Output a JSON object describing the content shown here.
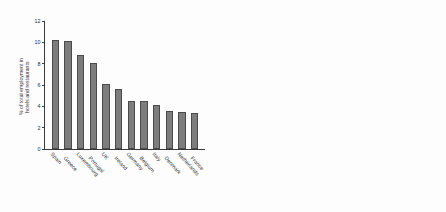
{
  "figure": {
    "background": "#fdfdfd",
    "bar_color": "#7d7d7d",
    "bar_edge_color": "#4a4a4a",
    "axis_color": "#3a3a3a",
    "text_color": "#2b2b2b"
  },
  "chart_data": [
    {
      "type": "bar",
      "title": "",
      "xlabel": "",
      "ylabel": "% of total employment in\nhotels and restaurants",
      "ylim": [
        0,
        12
      ],
      "yticks": [
        0,
        2,
        4,
        6,
        8,
        10,
        12
      ],
      "ytick_labels": [
        "0",
        "2",
        "4",
        "6",
        "8",
        "10",
        "12"
      ],
      "grid": false,
      "legend": false,
      "categories": [
        "Spain",
        "Greece",
        "Luxembourg",
        "Portugal",
        "UK",
        "Ireland",
        "Germany",
        "Belgium",
        "Italy",
        "Denmark",
        "Netherlands",
        "France"
      ],
      "values": [
        10.2,
        10.1,
        8.8,
        8.1,
        6.1,
        5.6,
        4.5,
        4.5,
        4.1,
        3.6,
        3.5,
        3.4
      ]
    },
    {
      "type": "bar",
      "title": "",
      "xlabel": "",
      "ylabel": "% of total workforce estimated\nin tourism employment",
      "ylim": [
        0,
        12
      ],
      "yticks": [
        0,
        2,
        4,
        6,
        8,
        10,
        12
      ],
      "ytick_labels": [
        "0",
        "2",
        "4",
        "6",
        "8",
        "10",
        "12"
      ],
      "grid": false,
      "legend": false,
      "categories": [
        "Spain",
        "Portugal",
        "Greece",
        "France",
        "Italy",
        "Ireland",
        "UK",
        "Denmark",
        "Luxembourg",
        "Germany",
        "Belgium",
        "Netherlands"
      ],
      "values": [
        9.5,
        8.8,
        7.35,
        7.0,
        6.5,
        6.4,
        6.1,
        5.4,
        5.25,
        5.25,
        3.95,
        2.3
      ]
    }
  ]
}
